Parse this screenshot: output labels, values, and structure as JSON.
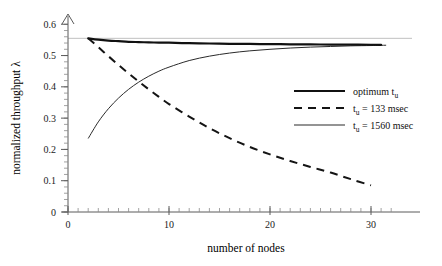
{
  "chart_data": {
    "type": "line",
    "title": "",
    "xlabel": "number of nodes",
    "ylabel": "normalized throughput λ",
    "xlim": [
      0,
      32
    ],
    "ylim": [
      0,
      0.62
    ],
    "grid": false,
    "legend_position": "right-middle",
    "x_ticks": [
      0,
      10,
      20,
      30
    ],
    "x_tick_labels": [
      "0",
      "10",
      "20",
      "30"
    ],
    "x_minor_step": 1,
    "y_ticks": [
      0,
      0.1,
      0.2,
      0.3,
      0.4,
      0.5,
      0.6
    ],
    "y_tick_labels": [
      "0",
      "0.1",
      "0.2",
      "0.3",
      "0.4",
      "0.5",
      "0.6"
    ],
    "y_minor_step": 0.02,
    "reference_line_y": 0.555,
    "series": [
      {
        "name": "optimum t_u",
        "style": "thick-solid",
        "color": "#111111",
        "x": [
          2,
          3,
          4,
          5,
          6,
          7,
          8,
          9,
          10,
          12,
          14,
          16,
          18,
          20,
          22,
          24,
          26,
          28,
          30,
          31
        ],
        "values": [
          0.555,
          0.551,
          0.548,
          0.546,
          0.544,
          0.543,
          0.542,
          0.5415,
          0.541,
          0.5395,
          0.5385,
          0.5375,
          0.537,
          0.5365,
          0.536,
          0.5355,
          0.535,
          0.5348,
          0.5345,
          0.5344
        ]
      },
      {
        "name": "t_u = 133 msec",
        "style": "dashed",
        "color": "#141414",
        "x": [
          2,
          3,
          4,
          5,
          6,
          7,
          8,
          9,
          10,
          12,
          14,
          16,
          18,
          20,
          22,
          24,
          26,
          28,
          30
        ],
        "values": [
          0.555,
          0.527,
          0.498,
          0.47,
          0.443,
          0.417,
          0.392,
          0.368,
          0.345,
          0.305,
          0.268,
          0.236,
          0.208,
          0.184,
          0.163,
          0.144,
          0.126,
          0.105,
          0.085
        ]
      },
      {
        "name": "t_u = 1560 msec",
        "style": "thin-solid",
        "color": "#2a2a2a",
        "x": [
          2,
          3,
          4,
          5,
          6,
          7,
          8,
          9,
          10,
          12,
          14,
          16,
          18,
          20,
          22,
          24,
          26,
          28,
          30,
          31.5
        ],
        "values": [
          0.235,
          0.288,
          0.33,
          0.364,
          0.392,
          0.415,
          0.434,
          0.45,
          0.463,
          0.484,
          0.498,
          0.508,
          0.515,
          0.52,
          0.524,
          0.527,
          0.529,
          0.531,
          0.532,
          0.533
        ]
      }
    ],
    "legend": [
      {
        "label_prefix": "optimum t",
        "label_sub": "u",
        "label_suffix": "",
        "style": "thick-solid"
      },
      {
        "label_prefix": "t",
        "label_sub": "u",
        "label_suffix": " = 133 msec",
        "style": "dashed"
      },
      {
        "label_prefix": "t",
        "label_sub": "u",
        "label_suffix": " = 1560 msec",
        "style": "thin-solid"
      }
    ]
  }
}
